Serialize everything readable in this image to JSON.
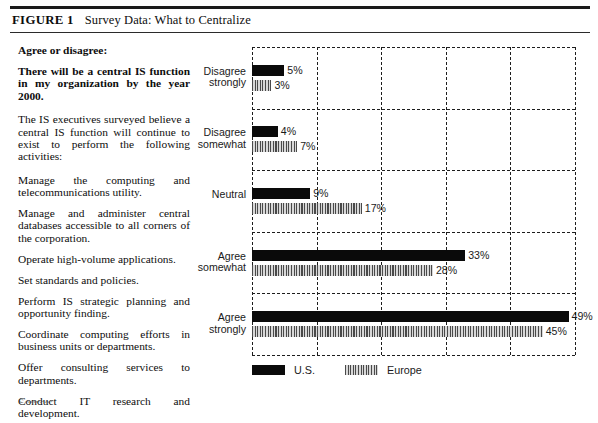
{
  "figure": {
    "number_label": "FIGURE 1",
    "title": "Survey Data: What to Centralize"
  },
  "prose": {
    "heading": "Agree or disagree:",
    "question": "There will be a central IS function in my organization by the year 2000.",
    "lead": "The IS executives surveyed believe a central IS function will continue to exist to perform the following activities:",
    "activities": [
      "Manage the computing and telecommunications utility.",
      "Manage and administer central databases accessible to all corners of the corporation.",
      "Operate high-volume applications.",
      "Set standards and policies.",
      "Perform IS strategic planning and opportunity finding.",
      "Coordinate computing efforts in business units or departments.",
      "Offer consulting services to departments.",
      "Conduct IT research and development."
    ],
    "cut_off_line": "Source:"
  },
  "chart_data": {
    "type": "bar",
    "orientation": "horizontal",
    "title": "Survey Data: What to Centralize",
    "xlabel": "",
    "ylabel": "",
    "xlim": [
      0,
      50
    ],
    "xticks": [
      0,
      10,
      20,
      30,
      40,
      50
    ],
    "xtick_labels": [
      "",
      "",
      "",
      "",
      "",
      ""
    ],
    "grid": "dashed, vertical and horizontal",
    "legend_position": "bottom-left",
    "value_suffix": "%",
    "categories": [
      "Disagree\nstrongly",
      "Disagree\nsomewhat",
      "Neutral",
      "Agree\nsomewhat",
      "Agree\nstrongly"
    ],
    "series": [
      {
        "name": "U.S.",
        "style": "solid-black",
        "color": "#0a0a0a",
        "values": [
          5,
          4,
          9,
          33,
          49
        ],
        "labels": [
          "5%",
          "4%",
          "9%",
          "33%",
          "49%"
        ]
      },
      {
        "name": "Europe",
        "style": "vertical-hatch-gray",
        "color": "#b4b4b4",
        "values": [
          3,
          7,
          17,
          28,
          45
        ],
        "labels": [
          "3%",
          "7%",
          "17%",
          "28%",
          "45%"
        ]
      }
    ]
  },
  "legend": {
    "items": [
      {
        "label": "U.S."
      },
      {
        "label": "Europe"
      }
    ]
  }
}
